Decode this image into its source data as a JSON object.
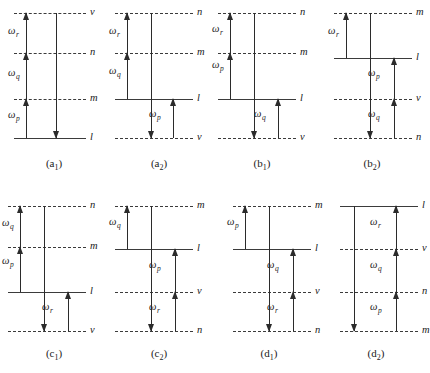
{
  "figure": {
    "columns": 4,
    "rows": 2,
    "level_line_color": "#3b3b3b",
    "arrow_color": "#2b2b2b",
    "background": "#ffffff"
  },
  "panels": [
    {
      "id": "a1",
      "caption_main": "(a",
      "caption_sub": "1",
      "caption_close": ")",
      "levels": [
        {
          "label": "v",
          "style": "dashed"
        },
        {
          "label": "n",
          "style": "dashed"
        },
        {
          "label": "m",
          "style": "dashed"
        },
        {
          "label": "l",
          "style": "solid"
        }
      ],
      "arrows": [
        {
          "symbol": "ω",
          "sub": "r",
          "dir": "up"
        },
        {
          "symbol": "ω",
          "sub": "q",
          "dir": "up"
        },
        {
          "symbol": "ω",
          "sub": "p",
          "dir": "up"
        },
        {
          "symbol": "",
          "sub": "",
          "dir": "down"
        }
      ]
    },
    {
      "id": "a2",
      "caption_main": "(a",
      "caption_sub": "2",
      "caption_close": ")",
      "levels": [
        {
          "label": "n",
          "style": "dashed"
        },
        {
          "label": "m",
          "style": "dashed"
        },
        {
          "label": "l",
          "style": "solid"
        },
        {
          "label": "v",
          "style": "dashed"
        }
      ],
      "arrows": [
        {
          "symbol": "ω",
          "sub": "r",
          "dir": "up"
        },
        {
          "symbol": "ω",
          "sub": "q",
          "dir": "up"
        },
        {
          "symbol": "ω",
          "sub": "p",
          "dir": "up"
        },
        {
          "symbol": "",
          "sub": "",
          "dir": "down"
        }
      ]
    },
    {
      "id": "b1",
      "caption_main": "(b",
      "caption_sub": "1",
      "caption_close": ")",
      "levels": [
        {
          "label": "n",
          "style": "dashed"
        },
        {
          "label": "m",
          "style": "dashed"
        },
        {
          "label": "l",
          "style": "solid"
        },
        {
          "label": "v",
          "style": "dashed"
        }
      ],
      "arrows": [
        {
          "symbol": "ω",
          "sub": "r",
          "dir": "up"
        },
        {
          "symbol": "ω",
          "sub": "p",
          "dir": "up"
        },
        {
          "symbol": "ω",
          "sub": "q",
          "dir": "up"
        },
        {
          "symbol": "",
          "sub": "",
          "dir": "down"
        }
      ]
    },
    {
      "id": "b2",
      "caption_main": "(b",
      "caption_sub": "2",
      "caption_close": ")",
      "levels": [
        {
          "label": "m",
          "style": "dashed"
        },
        {
          "label": "l",
          "style": "solid"
        },
        {
          "label": "v",
          "style": "dashed"
        },
        {
          "label": "n",
          "style": "dashed"
        }
      ],
      "arrows": [
        {
          "symbol": "ω",
          "sub": "r",
          "dir": "up"
        },
        {
          "symbol": "ω",
          "sub": "p",
          "dir": "up"
        },
        {
          "symbol": "ω",
          "sub": "q",
          "dir": "up"
        },
        {
          "symbol": "",
          "sub": "",
          "dir": "down"
        }
      ]
    },
    {
      "id": "c1",
      "caption_main": "(c",
      "caption_sub": "1",
      "caption_close": ")",
      "levels": [
        {
          "label": "n",
          "style": "dashed"
        },
        {
          "label": "m",
          "style": "dashed"
        },
        {
          "label": "l",
          "style": "solid"
        },
        {
          "label": "v",
          "style": "dashed"
        }
      ],
      "arrows": [
        {
          "symbol": "ω",
          "sub": "q",
          "dir": "up"
        },
        {
          "symbol": "ω",
          "sub": "p",
          "dir": "up"
        },
        {
          "symbol": "ω",
          "sub": "r",
          "dir": "up"
        },
        {
          "symbol": "",
          "sub": "",
          "dir": "down"
        }
      ]
    },
    {
      "id": "c2",
      "caption_main": "(c",
      "caption_sub": "2",
      "caption_close": ")",
      "levels": [
        {
          "label": "m",
          "style": "dashed"
        },
        {
          "label": "l",
          "style": "solid"
        },
        {
          "label": "v",
          "style": "dashed"
        },
        {
          "label": "n",
          "style": "dashed"
        }
      ],
      "arrows": [
        {
          "symbol": "ω",
          "sub": "q",
          "dir": "up"
        },
        {
          "symbol": "ω",
          "sub": "p",
          "dir": "up"
        },
        {
          "symbol": "ω",
          "sub": "r",
          "dir": "up"
        },
        {
          "symbol": "",
          "sub": "",
          "dir": "down"
        }
      ]
    },
    {
      "id": "d1",
      "caption_main": "(d",
      "caption_sub": "1",
      "caption_close": ")",
      "levels": [
        {
          "label": "m",
          "style": "dashed"
        },
        {
          "label": "l",
          "style": "solid"
        },
        {
          "label": "v",
          "style": "dashed"
        },
        {
          "label": "n",
          "style": "dashed"
        }
      ],
      "arrows": [
        {
          "symbol": "ω",
          "sub": "p",
          "dir": "up"
        },
        {
          "symbol": "ω",
          "sub": "q",
          "dir": "up"
        },
        {
          "symbol": "ω",
          "sub": "r",
          "dir": "up"
        },
        {
          "symbol": "",
          "sub": "",
          "dir": "down"
        }
      ]
    },
    {
      "id": "d2",
      "caption_main": "(d",
      "caption_sub": "2",
      "caption_close": ")",
      "levels": [
        {
          "label": "l",
          "style": "solid"
        },
        {
          "label": "v",
          "style": "dashed"
        },
        {
          "label": "n",
          "style": "dashed"
        },
        {
          "label": "m",
          "style": "dashed"
        }
      ],
      "arrows": [
        {
          "symbol": "ω",
          "sub": "r",
          "dir": "up"
        },
        {
          "symbol": "ω",
          "sub": "q",
          "dir": "up"
        },
        {
          "symbol": "ω",
          "sub": "p",
          "dir": "up"
        },
        {
          "symbol": "",
          "sub": "",
          "dir": "down"
        }
      ]
    }
  ]
}
